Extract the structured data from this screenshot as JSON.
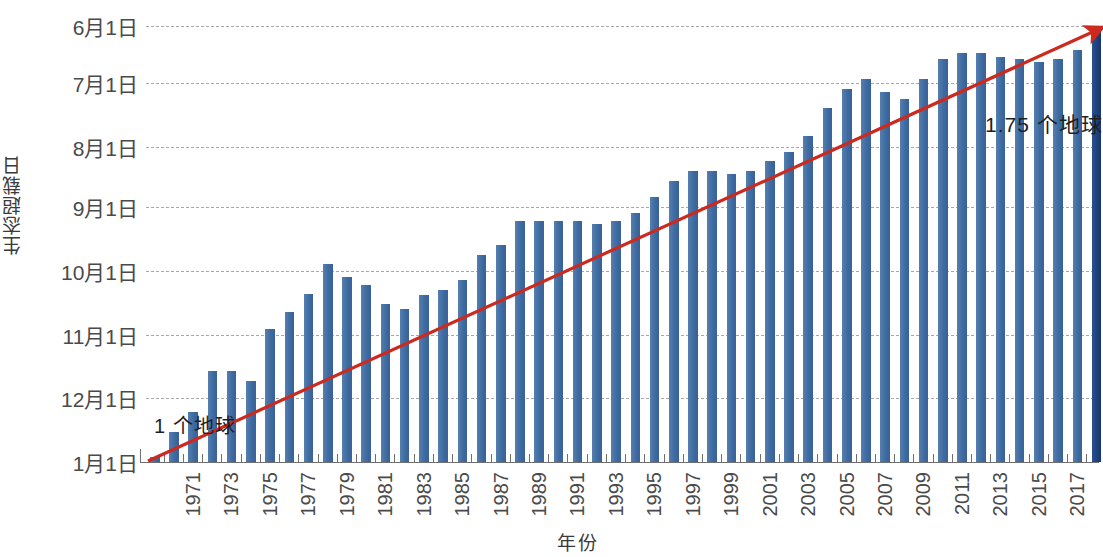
{
  "chart_data": {
    "type": "bar",
    "title": "",
    "ylabel": "生态超载日",
    "xlabel": "年份",
    "grid": true,
    "legend": null,
    "y_tick_labels": [
      "6月1日",
      "7月1日",
      "8月1日",
      "9月1日",
      "10月1日",
      "11月1日",
      "12月1日",
      "1月1日"
    ],
    "y_axis_note": "Y axis is a calendar date axis, inverted: earlier dates (6月1日) at top, 1月1日 at bottom baseline",
    "y_tick_day_of_year": [
      152,
      182,
      213,
      244,
      274,
      305,
      335,
      366
    ],
    "x_tick_labels": [
      "1971",
      "1973",
      "1975",
      "1977",
      "1979",
      "1981",
      "1983",
      "1985",
      "1987",
      "1989",
      "1991",
      "1993",
      "1995",
      "1997",
      "1999",
      "2001",
      "2003",
      "2005",
      "2007",
      "2009",
      "2011",
      "2013",
      "2015",
      "2017",
      "2019"
    ],
    "x_tick_step_years": 2,
    "categories": [
      "1970",
      "1971",
      "1972",
      "1973",
      "1974",
      "1975",
      "1976",
      "1977",
      "1978",
      "1979",
      "1980",
      "1981",
      "1982",
      "1983",
      "1984",
      "1985",
      "1986",
      "1987",
      "1988",
      "1989",
      "1990",
      "1991",
      "1992",
      "1993",
      "1994",
      "1995",
      "1996",
      "1997",
      "1998",
      "1999",
      "2000",
      "2001",
      "2002",
      "2003",
      "2004",
      "2005",
      "2006",
      "2007",
      "2008",
      "2009",
      "2010",
      "2011",
      "2012",
      "2013",
      "2014",
      "2015",
      "2016",
      "2017",
      "2018",
      "2019"
    ],
    "values_label": "Earth Overshoot Day (date); plotted as day-of-year counted back from 1月1日 baseline",
    "values": [
      "12月30日",
      "12月22日",
      "12月14日",
      "12月1日",
      "12月1日",
      "12月4日",
      "11月19日",
      "11月13日",
      "11月8日",
      "10月30日",
      "11月3日",
      "11月6日",
      "11月12日",
      "11月13日",
      "11月9日",
      "11月7日",
      "11月4日",
      "10月27日",
      "10月24日",
      "10月17日",
      "10月17日",
      "10月17日",
      "10月17日",
      "10月18日",
      "10月17日",
      "10月14日",
      "10月9日",
      "10月4日",
      "10月1日",
      "10月1日",
      "10月2日",
      "10月1日",
      "9月28日",
      "9月25日",
      "9月20日",
      "9月11日",
      "9月6日",
      "9月3日",
      "9月7日",
      "9月9日",
      "9月3日",
      "8月27日",
      "8月25日",
      "8月25日",
      "8月26日",
      "8月27日",
      "8月28日",
      "8月27日",
      "8月24日",
      "8月1日"
    ],
    "bar_heights_frac_of_axis": [
      0.012,
      0.068,
      0.115,
      0.208,
      0.208,
      0.186,
      0.305,
      0.345,
      0.385,
      0.455,
      0.425,
      0.405,
      0.362,
      0.35,
      0.382,
      0.395,
      0.418,
      0.475,
      0.498,
      0.552,
      0.552,
      0.552,
      0.552,
      0.545,
      0.552,
      0.572,
      0.608,
      0.645,
      0.668,
      0.668,
      0.66,
      0.668,
      0.69,
      0.712,
      0.748,
      0.812,
      0.855,
      0.878,
      0.848,
      0.832,
      0.878,
      0.925,
      0.938,
      0.938,
      0.928,
      0.925,
      0.918,
      0.925,
      0.945,
      1.0
    ],
    "annotations": [
      {
        "id": "one-earth",
        "text": "1 个地球",
        "x_year": 1971,
        "position": "lower-left"
      },
      {
        "id": "one-point-seven-five-earths",
        "text": "1.75 个地球",
        "x_year": 2019,
        "position": "upper-right"
      }
    ],
    "trendline": {
      "type": "arrow",
      "color": "#cc2a1f",
      "from_year": 1970,
      "to_year": 2019,
      "label": "red arrow from 1 个地球 to 1.75 个地球"
    },
    "colors": {
      "bar": "#4573a7",
      "bar_last": "#1d3f7d",
      "trend_arrow": "#cc2a1f",
      "grid": "#9a9a9a",
      "axis": "#6f6f6f",
      "text": "#4a4a4a",
      "background": "#ffffff"
    }
  }
}
